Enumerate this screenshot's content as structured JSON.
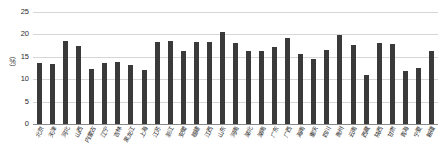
{
  "chart_data": {
    "type": "bar",
    "title": "",
    "subtitle": "",
    "xlabel": "",
    "ylabel": "（%）",
    "ylim": [
      0,
      25
    ],
    "yticks": [
      0,
      5,
      10,
      15,
      20,
      25
    ],
    "ytick_labels": [
      "0",
      "5",
      "10",
      "15",
      "20",
      "25"
    ],
    "grid": true,
    "legend": false,
    "legend_position": "none",
    "bar_color": "#3a3a3a",
    "gridline_color": "#d6d6d6",
    "axis_color": "#8a8a8a",
    "categories": [
      "北京",
      "天津",
      "河北",
      "山西",
      "内蒙古",
      "辽宁",
      "吉林",
      "黑龙江",
      "上海",
      "江苏",
      "浙江",
      "安徽",
      "福建",
      "江西",
      "山东",
      "河南",
      "湖北",
      "湖南",
      "广东",
      "广西",
      "海南",
      "重庆",
      "四川",
      "贵州",
      "云南",
      "西藏",
      "陕西",
      "甘肃",
      "青海",
      "宁夏",
      "新疆"
    ],
    "values": [
      13.6,
      13.4,
      18.5,
      17.4,
      12.2,
      13.7,
      13.8,
      13.1,
      12.1,
      18.3,
      18.6,
      16.4,
      18.4,
      18.3,
      20.6,
      18.1,
      16.3,
      16.3,
      17.3,
      19.2,
      15.7,
      14.6,
      16.5,
      19.9,
      17.6,
      11.0,
      18.0,
      17.8,
      11.8,
      12.6,
      16.4
    ]
  }
}
